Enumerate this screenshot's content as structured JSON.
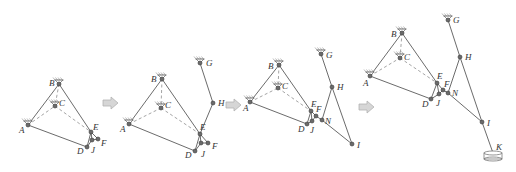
{
  "figure": {
    "colors": {
      "link": "#5a5a5a",
      "dashed": "#9a9a9a",
      "joint": "#6a6a6a",
      "arrow_fill": "#d6d6d6",
      "label": "#333333"
    }
  },
  "arrows": [
    {
      "name": "step-arrow-1",
      "x": 103,
      "y": 97
    },
    {
      "name": "step-arrow-2",
      "x": 226,
      "y": 99
    },
    {
      "name": "step-arrow-3",
      "x": 359,
      "y": 101
    }
  ],
  "panels": [
    {
      "name": "stage-1",
      "points": {
        "A": [
          28,
          125
        ],
        "B": [
          59,
          84
        ],
        "C": [
          55,
          106
        ],
        "D": [
          87,
          147
        ],
        "E": [
          91,
          132
        ],
        "F": [
          98,
          139
        ],
        "J": [
          92,
          140
        ]
      },
      "grounds": [
        "A",
        "B",
        "C"
      ],
      "links": [
        [
          "A",
          "B"
        ],
        [
          "B",
          "E"
        ],
        [
          "A",
          "D"
        ],
        [
          "D",
          "E"
        ],
        [
          "E",
          "F"
        ],
        [
          "F",
          "J"
        ],
        [
          "J",
          "D"
        ],
        [
          "E",
          "J"
        ]
      ],
      "dashed": [
        [
          "A",
          "C"
        ],
        [
          "C",
          "E"
        ],
        [
          "B",
          "C"
        ]
      ],
      "labels": [
        {
          "t": "A",
          "x": 19,
          "y": 133
        },
        {
          "t": "B",
          "x": 49,
          "y": 86
        },
        {
          "t": "C",
          "x": 59,
          "y": 106
        },
        {
          "t": "D",
          "x": 77,
          "y": 154
        },
        {
          "t": "E",
          "x": 93,
          "y": 130
        },
        {
          "t": "F",
          "x": 101,
          "y": 146
        },
        {
          "t": "J",
          "x": 91,
          "y": 153
        }
      ]
    },
    {
      "name": "stage-2",
      "points": {
        "A": [
          129,
          124
        ],
        "B": [
          162,
          79
        ],
        "C": [
          161,
          108
        ],
        "D": [
          195,
          151
        ],
        "E": [
          200,
          134
        ],
        "F": [
          208,
          143
        ],
        "J": [
          201,
          143
        ],
        "G": [
          200,
          63
        ],
        "H": [
          213,
          103
        ]
      },
      "grounds": [
        "A",
        "B",
        "C",
        "G"
      ],
      "links": [
        [
          "A",
          "B"
        ],
        [
          "B",
          "E"
        ],
        [
          "A",
          "D"
        ],
        [
          "D",
          "E"
        ],
        [
          "E",
          "F"
        ],
        [
          "F",
          "J"
        ],
        [
          "J",
          "D"
        ],
        [
          "E",
          "J"
        ],
        [
          "G",
          "H"
        ],
        [
          "H",
          "E"
        ]
      ],
      "dashed": [
        [
          "A",
          "C"
        ],
        [
          "C",
          "E"
        ],
        [
          "B",
          "C"
        ]
      ],
      "labels": [
        {
          "t": "A",
          "x": 120,
          "y": 132
        },
        {
          "t": "B",
          "x": 151,
          "y": 82
        },
        {
          "t": "C",
          "x": 165,
          "y": 108
        },
        {
          "t": "D",
          "x": 185,
          "y": 158
        },
        {
          "t": "E",
          "x": 200,
          "y": 130
        },
        {
          "t": "F",
          "x": 212,
          "y": 149
        },
        {
          "t": "J",
          "x": 201,
          "y": 157
        },
        {
          "t": "G",
          "x": 206,
          "y": 66
        },
        {
          "t": "H",
          "x": 218,
          "y": 106
        }
      ]
    },
    {
      "name": "stage-3",
      "points": {
        "A": [
          250,
          102
        ],
        "B": [
          279,
          65
        ],
        "C": [
          278,
          88
        ],
        "D": [
          307,
          124
        ],
        "E": [
          311,
          111
        ],
        "F": [
          316,
          116
        ],
        "J": [
          312,
          121
        ],
        "N": [
          322,
          120
        ],
        "G": [
          321,
          54
        ],
        "H": [
          332,
          87
        ],
        "I": [
          352,
          144
        ]
      },
      "grounds": [
        "A",
        "B",
        "C",
        "G"
      ],
      "links": [
        [
          "A",
          "B"
        ],
        [
          "B",
          "E"
        ],
        [
          "A",
          "D"
        ],
        [
          "D",
          "E"
        ],
        [
          "E",
          "F"
        ],
        [
          "F",
          "J"
        ],
        [
          "J",
          "D"
        ],
        [
          "E",
          "J"
        ],
        [
          "G",
          "H"
        ],
        [
          "H",
          "N"
        ],
        [
          "H",
          "I"
        ],
        [
          "F",
          "N"
        ],
        [
          "N",
          "I"
        ]
      ],
      "dashed": [
        [
          "A",
          "C"
        ],
        [
          "C",
          "E"
        ],
        [
          "B",
          "C"
        ]
      ],
      "labels": [
        {
          "t": "A",
          "x": 243,
          "y": 111
        },
        {
          "t": "B",
          "x": 268,
          "y": 69
        },
        {
          "t": "C",
          "x": 282,
          "y": 89
        },
        {
          "t": "D",
          "x": 298,
          "y": 132
        },
        {
          "t": "E",
          "x": 311,
          "y": 107
        },
        {
          "t": "F",
          "x": 316,
          "y": 112
        },
        {
          "t": "J",
          "x": 310,
          "y": 133
        },
        {
          "t": "N",
          "x": 325,
          "y": 124
        },
        {
          "t": "G",
          "x": 326,
          "y": 58
        },
        {
          "t": "H",
          "x": 337,
          "y": 90
        },
        {
          "t": "I",
          "x": 357,
          "y": 148
        }
      ]
    },
    {
      "name": "stage-4",
      "points": {
        "A": [
          370,
          76
        ],
        "B": [
          402,
          33
        ],
        "C": [
          400,
          58
        ],
        "D": [
          431,
          99
        ],
        "E": [
          437,
          83
        ],
        "F": [
          443,
          90
        ],
        "J": [
          439,
          94
        ],
        "N": [
          448,
          93
        ],
        "G": [
          448,
          20
        ],
        "H": [
          460,
          57
        ],
        "I": [
          482,
          122
        ],
        "K": [
          493,
          153
        ]
      },
      "grounds": [
        "A",
        "B",
        "C",
        "G"
      ],
      "base": "K",
      "links": [
        [
          "A",
          "B"
        ],
        [
          "B",
          "E"
        ],
        [
          "A",
          "D"
        ],
        [
          "D",
          "E"
        ],
        [
          "E",
          "F"
        ],
        [
          "F",
          "J"
        ],
        [
          "J",
          "D"
        ],
        [
          "E",
          "J"
        ],
        [
          "G",
          "H"
        ],
        [
          "H",
          "N"
        ],
        [
          "H",
          "I"
        ],
        [
          "F",
          "N"
        ],
        [
          "N",
          "I"
        ],
        [
          "I",
          "K"
        ]
      ],
      "dashed": [
        [
          "A",
          "C"
        ],
        [
          "C",
          "E"
        ],
        [
          "B",
          "C"
        ]
      ],
      "labels": [
        {
          "t": "A",
          "x": 363,
          "y": 86
        },
        {
          "t": "B",
          "x": 391,
          "y": 37
        },
        {
          "t": "C",
          "x": 404,
          "y": 60
        },
        {
          "t": "D",
          "x": 422,
          "y": 107
        },
        {
          "t": "E",
          "x": 437,
          "y": 79
        },
        {
          "t": "F",
          "x": 444,
          "y": 87
        },
        {
          "t": "J",
          "x": 436,
          "y": 106
        },
        {
          "t": "N",
          "x": 452,
          "y": 96
        },
        {
          "t": "G",
          "x": 453,
          "y": 23
        },
        {
          "t": "H",
          "x": 465,
          "y": 60
        },
        {
          "t": "I",
          "x": 487,
          "y": 126
        },
        {
          "t": "K",
          "x": 496,
          "y": 150
        }
      ]
    }
  ]
}
